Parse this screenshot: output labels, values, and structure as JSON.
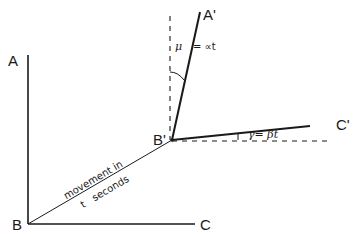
{
  "diagram": {
    "points": {
      "A": {
        "label": "A",
        "x": 28,
        "y": 55
      },
      "B": {
        "label": "B",
        "x": 28,
        "y": 224
      },
      "C": {
        "label": "C",
        "x": 195,
        "y": 224
      },
      "A_prime": {
        "label": "A'",
        "x": 200,
        "y": 10
      },
      "B_prime": {
        "label": "B'",
        "x": 172,
        "y": 140
      },
      "C_prime": {
        "label": "C'",
        "x": 310,
        "y": 127
      }
    },
    "annotations": {
      "movement_line1": "movement in",
      "movement_line2": "t   seconds",
      "mu_symbol": "μ",
      "mu_expr": "= ∝t",
      "gamma_expr": "γ= βt"
    },
    "colors": {
      "line": "#1a1a1a",
      "background": "#ffffff"
    }
  }
}
